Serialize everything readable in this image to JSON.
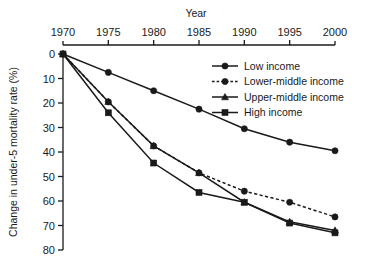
{
  "chart_data": {
    "type": "line",
    "title": "Year",
    "xlabel": "Year",
    "ylabel": "Change in under-5 mortality rate (%)",
    "x": [
      1970,
      1975,
      1980,
      1985,
      1990,
      1995,
      2000
    ],
    "xticklabels": [
      "1970",
      "1975",
      "1980",
      "1985",
      "1990",
      "1995",
      "2000"
    ],
    "yticklabels": [
      "0",
      "10",
      "20",
      "30",
      "40",
      "50",
      "60",
      "70",
      "80"
    ],
    "yticks": [
      0,
      10,
      20,
      30,
      40,
      50,
      60,
      70,
      80
    ],
    "xlim": [
      1970,
      2000
    ],
    "ylim": [
      0,
      80
    ],
    "y_axis_inverted": true,
    "grid": false,
    "legend_position": "upper-right-inside",
    "series": [
      {
        "name": "Low income",
        "values": [
          0,
          7.5,
          15,
          22.5,
          30.5,
          36,
          39.5
        ],
        "marker": "circle",
        "linestyle": "solid",
        "color": "#1a1a1a"
      },
      {
        "name": "Lower-middle income",
        "values": [
          0,
          19.5,
          37.5,
          48.5,
          56,
          60.5,
          66.5
        ],
        "marker": "circle",
        "linestyle": "dashed",
        "color": "#1a1a1a"
      },
      {
        "name": "Upper-middle income",
        "values": [
          0,
          19.5,
          37.5,
          48.5,
          60.5,
          68.5,
          72
        ],
        "marker": "triangle",
        "linestyle": "solid",
        "color": "#1a1a1a"
      },
      {
        "name": "High income",
        "values": [
          0,
          24,
          44.5,
          56.5,
          60.5,
          69,
          73
        ],
        "marker": "square",
        "linestyle": "solid",
        "color": "#1a1a1a"
      }
    ]
  },
  "legend": {
    "items": [
      {
        "label": "Low income"
      },
      {
        "label": "Lower-middle income"
      },
      {
        "label": "Upper-middle income"
      },
      {
        "label": "High income"
      }
    ]
  }
}
